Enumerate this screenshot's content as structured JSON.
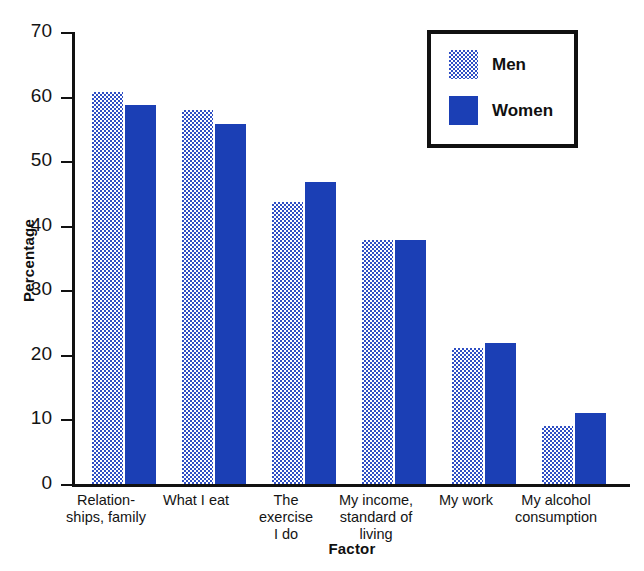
{
  "chart_data": {
    "type": "bar",
    "title": "",
    "xlabel": "Factor",
    "ylabel": "Percentage",
    "ylim": [
      0,
      70
    ],
    "yticks": [
      0,
      10,
      20,
      30,
      40,
      50,
      60,
      70
    ],
    "grid": false,
    "legend_position": "top-right",
    "categories": [
      "Relation-\nships, family",
      "What I eat",
      "The\nexercise\nI do",
      "My income,\nstandard of\nliving",
      "My work",
      "My alcohol\nconsumption"
    ],
    "category_lines": [
      [
        "Relation-",
        "ships, family"
      ],
      [
        "What I eat"
      ],
      [
        "The",
        "exercise",
        "I do"
      ],
      [
        "My income,",
        "standard of",
        "living"
      ],
      [
        "My work"
      ],
      [
        "My alcohol",
        "consumption"
      ]
    ],
    "series": [
      {
        "name": "Men",
        "color": "#6f86d6",
        "values": [
          60.7,
          58.0,
          43.7,
          37.8,
          21.0,
          9.0
        ]
      },
      {
        "name": "Women",
        "color": "#1b3fb5",
        "values": [
          58.7,
          55.8,
          46.7,
          37.8,
          21.8,
          11.0
        ]
      }
    ]
  },
  "legend": {
    "men_label": "Men",
    "women_label": "Women"
  },
  "axes": {
    "y_title": "Percentage",
    "x_title": "Factor",
    "tick_labels": [
      "70",
      "60",
      "50",
      "40",
      "30",
      "20",
      "10",
      "0"
    ]
  },
  "colors": {
    "men_fill": "#6f86d6",
    "women_fill": "#1b3fb5",
    "axis": "#111111",
    "background": "#ffffff"
  }
}
